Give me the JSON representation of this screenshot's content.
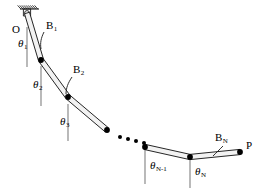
{
  "figure": {
    "type": "mechanics-diagram",
    "stroke_color": "#1a1a1a",
    "joint_color": "#000000",
    "link_fill": "#f2f2f2",
    "reference_line_color": "#808080",
    "background": "#ffffff"
  },
  "labels": {
    "origin": "O",
    "endpoint": "P",
    "body_1": "B",
    "body_1_sub": "1",
    "body_2": "B",
    "body_2_sub": "2",
    "body_N": "B",
    "body_N_sub": "N",
    "theta": "θ",
    "theta_1_sub": "1",
    "theta_2_sub": "2",
    "theta_3_sub": "3",
    "theta_Nminus1_sub": "N-1",
    "theta_N_sub": "N",
    "ellipsis": "• • •"
  },
  "geometry": {
    "support": {
      "x1": 20,
      "y1": 9,
      "x2": 39,
      "y2": 9,
      "hatch_count": 9
    },
    "pivot": {
      "x": 27,
      "y": 13,
      "r": 2.4
    },
    "joints": [
      {
        "name": "O",
        "x": 27,
        "y": 13
      },
      {
        "name": "J1",
        "x": 41,
        "y": 60
      },
      {
        "name": "J2",
        "x": 68,
        "y": 97
      },
      {
        "name": "J3",
        "x": 107,
        "y": 130
      },
      {
        "name": "JA",
        "x": 145,
        "y": 147
      },
      {
        "name": "JB",
        "x": 190,
        "y": 157
      },
      {
        "name": "P",
        "x": 240,
        "y": 152
      }
    ],
    "links": [
      {
        "name": "B1",
        "from": 0,
        "to": 1,
        "half_width": 2.6
      },
      {
        "name": "B2",
        "from": 1,
        "to": 2,
        "half_width": 2.6
      },
      {
        "name": "B3",
        "from": 2,
        "to": 3,
        "half_width": 2.6
      },
      {
        "name": "Bk",
        "from": 4,
        "to": 5,
        "half_width": 2.6
      },
      {
        "name": "BN",
        "from": 5,
        "to": 6,
        "half_width": 2.6
      }
    ],
    "reference_lines": [
      {
        "for": "theta_1",
        "x": 27,
        "y1": 27,
        "y2": 67
      },
      {
        "for": "theta_2",
        "x": 41,
        "y1": 66,
        "y2": 106
      },
      {
        "for": "theta_3",
        "x": 68,
        "y1": 104,
        "y2": 141
      },
      {
        "for": "theta_Nminus1",
        "x": 145,
        "y1": 150,
        "y2": 184
      },
      {
        "for": "theta_N",
        "x": 190,
        "y1": 160,
        "y2": 188
      }
    ],
    "ellipsis_dots": [
      {
        "x": 120,
        "y": 137
      },
      {
        "x": 128,
        "y": 139
      },
      {
        "x": 136,
        "y": 141
      },
      {
        "x": 144,
        "y": 143
      }
    ],
    "leaders": [
      {
        "for": "B1",
        "path": "M 44 32 C 41 38 40 43 41 49"
      },
      {
        "for": "B2",
        "path": "M 72 77 C 68 83 66 88 66 94"
      },
      {
        "for": "BN",
        "path": "M 223 146 C 219 150 216 153 213 156"
      }
    ]
  },
  "label_positions": {
    "O": {
      "x": 12,
      "y": 24
    },
    "P": {
      "x": 246,
      "y": 140
    },
    "B1": {
      "x": 46,
      "y": 20
    },
    "B2": {
      "x": 73,
      "y": 64
    },
    "BN": {
      "x": 215,
      "y": 132
    },
    "theta1": {
      "x": 18,
      "y": 38
    },
    "theta2": {
      "x": 33,
      "y": 79
    },
    "theta3": {
      "x": 60,
      "y": 116
    },
    "thetaNm1": {
      "x": 150,
      "y": 160
    },
    "thetaN": {
      "x": 195,
      "y": 166
    }
  }
}
